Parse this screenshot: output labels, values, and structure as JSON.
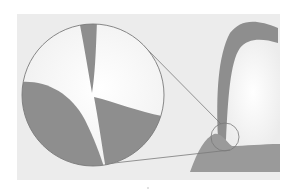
{
  "figure": {
    "colors": {
      "background": "#ffffff",
      "panel": "#ececec",
      "shape": "#8e8e8e",
      "light_fill": "#f7f7f7",
      "outline": "#7a7a7a"
    },
    "magnifier": {
      "large_circle": {
        "cx": 93,
        "cy": 95,
        "r": 71
      },
      "small_circle": {
        "cx": 225,
        "cy": 137,
        "r": 14
      }
    }
  }
}
